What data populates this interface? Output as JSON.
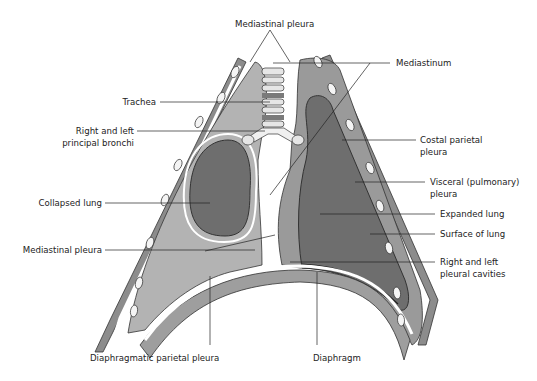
{
  "diagram": {
    "colors": {
      "chest_wall": "#8c8c8c",
      "rib": "#f4f4f4",
      "pleural_space": "#b3b3b3",
      "lung_dark": "#6e6e6e",
      "lung_mid": "#9a9a9a",
      "diaphragm": "#9e9e9e",
      "trachea_ring": "#e6e6e6",
      "trachea_band": "#7a7a7a",
      "outline": "#333333",
      "label_text": "#222222"
    },
    "labels": {
      "mediastinal_pleura_top": "Mediastinal pleura",
      "trachea": "Trachea",
      "bronchi_line1": "Right and left",
      "bronchi_line2": "principal bronchi",
      "collapsed_lung": "Collapsed lung",
      "mediastinal_pleura_left": "Mediastinal pleura",
      "diaphragmatic_parietal_pleura": "Diaphragmatic parietal pleura",
      "diaphragm": "Diaphragm",
      "mediastinum": "Mediastinum",
      "costal_line1": "Costal parietal",
      "costal_line2": "pleura",
      "visceral_line1": "Visceral (pulmonary)",
      "visceral_line2": "pleura",
      "expanded_lung": "Expanded lung",
      "surface_of_lung": "Surface of lung",
      "cavities_line1": "Right and left",
      "cavities_line2": "pleural cavities"
    }
  }
}
